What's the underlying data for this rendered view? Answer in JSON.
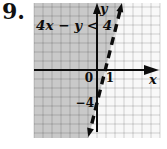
{
  "problem_number": "9.",
  "graph": {
    "inequality": "4x − y < 4",
    "x_axis_label": "x",
    "y_axis_label": "y",
    "origin_label": "0",
    "x_tick_label": "1",
    "y_tick_label": "−4"
  },
  "colors": {
    "shaded_region_fill": "#c9c9c9",
    "unshaded_fill": "#f8f8f8",
    "ink": "#0c0c0c"
  },
  "chart_data": {
    "type": "line",
    "boundary_line": {
      "equation": "4x − y = 4",
      "slope": 4,
      "y_intercept": -4,
      "x_intercept": 1,
      "style": "dashed-bold-with-arrows (boundary excluded, strict inequality)",
      "points": [
        [
          0,
          -4
        ],
        [
          1,
          0
        ]
      ]
    },
    "shaded_region": "half-plane to the left of the dashed line, where 4x − y < 4",
    "x_tick_labels": [
      "0",
      "1"
    ],
    "y_tick_labels": [
      "−4"
    ],
    "xlabel": "x",
    "ylabel": "y",
    "grid": true,
    "grid_units_per_cell": 1,
    "axis_arrows": [
      "x-right",
      "y-up"
    ]
  }
}
